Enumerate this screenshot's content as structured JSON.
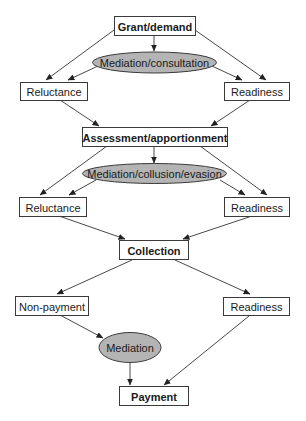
{
  "diagram": {
    "colors": {
      "box_fill": "#ffffff",
      "ellipse_fill": "#b4b4b4",
      "stroke": "#3a3a3a"
    },
    "nodes": {
      "grant_demand": {
        "label": "Grant/demand"
      },
      "mediation_consultation": {
        "label": "Mediation/consultation"
      },
      "reluctance_1": {
        "label": "Reluctance"
      },
      "readiness_1": {
        "label": "Readiness"
      },
      "assessment_apportionment": {
        "label": "Assessment/apportionment"
      },
      "mediation_collusion_evasion": {
        "label": "Mediation/collusion/evasion"
      },
      "reluctance_2": {
        "label": "Reluctance"
      },
      "readiness_2": {
        "label": "Readiness"
      },
      "collection": {
        "label": "Collection"
      },
      "non_payment": {
        "label": "Non-payment"
      },
      "readiness_3": {
        "label": "Readiness"
      },
      "mediation": {
        "label": "Mediation"
      },
      "payment": {
        "label": "Payment"
      }
    },
    "edges": [
      {
        "from": "Grant/demand",
        "to": "Mediation/consultation"
      },
      {
        "from": "Grant/demand",
        "to": "Reluctance"
      },
      {
        "from": "Grant/demand",
        "to": "Readiness"
      },
      {
        "from": "Mediation/consultation",
        "to": "Reluctance"
      },
      {
        "from": "Mediation/consultation",
        "to": "Readiness"
      },
      {
        "from": "Reluctance",
        "to": "Assessment/apportionment"
      },
      {
        "from": "Readiness",
        "to": "Assessment/apportionment"
      },
      {
        "from": "Assessment/apportionment",
        "to": "Mediation/collusion/evasion"
      },
      {
        "from": "Assessment/apportionment",
        "to": "Reluctance"
      },
      {
        "from": "Assessment/apportionment",
        "to": "Readiness"
      },
      {
        "from": "Mediation/collusion/evasion",
        "to": "Reluctance"
      },
      {
        "from": "Mediation/collusion/evasion",
        "to": "Readiness"
      },
      {
        "from": "Reluctance",
        "to": "Collection"
      },
      {
        "from": "Readiness",
        "to": "Collection"
      },
      {
        "from": "Collection",
        "to": "Non-payment"
      },
      {
        "from": "Collection",
        "to": "Readiness"
      },
      {
        "from": "Non-payment",
        "to": "Mediation"
      },
      {
        "from": "Mediation",
        "to": "Payment"
      },
      {
        "from": "Readiness",
        "to": "Payment"
      }
    ]
  }
}
